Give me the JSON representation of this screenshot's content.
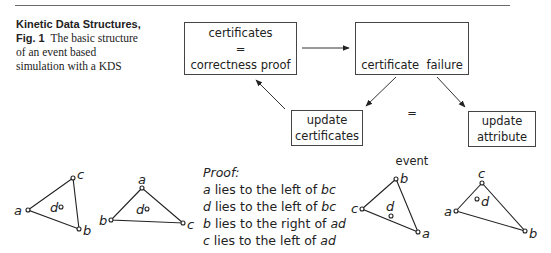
{
  "caption": {
    "heading": "Kinetic Data Structures,",
    "fig_label": "Fig. 1",
    "text_line1": "The basic structure",
    "text_line2": "of an event based",
    "text_line3": "simulation with a KDS"
  },
  "flow": {
    "boxes": [
      {
        "id": "certificates",
        "lines": [
          "certificates",
          "=",
          "correctness proof"
        ]
      },
      {
        "id": "certificate-failure",
        "lines": [
          "certificate  failure",
          "=",
          "event"
        ]
      },
      {
        "id": "update-certificates",
        "lines": [
          "update",
          "certificates"
        ]
      },
      {
        "id": "update-attribute",
        "lines": [
          "update",
          "attribute"
        ]
      }
    ],
    "edges": [
      {
        "from": "certificates",
        "to": "certificate-failure"
      },
      {
        "from": "certificate-failure",
        "to": "update-certificates"
      },
      {
        "from": "certificate-failure",
        "to": "update-attribute"
      },
      {
        "from": "update-certificates",
        "to": "certificates"
      }
    ]
  },
  "proof": {
    "title": "Proof:",
    "lines": [
      {
        "subject": "a",
        "text": " lies to the left of ",
        "object": "bc"
      },
      {
        "subject": "d",
        "text": " lies to the left of ",
        "object": "bc"
      },
      {
        "subject": "b",
        "text": " lies to the right of ",
        "object": "ad"
      },
      {
        "subject": "c",
        "text": " lies to the left of ",
        "object": "ad"
      }
    ]
  },
  "triangles": [
    {
      "points": {
        "a": "a",
        "b": "b",
        "c": "c"
      },
      "inner": "d"
    },
    {
      "points": {
        "a": "a",
        "b": "b",
        "c": "c"
      },
      "inner": "d"
    },
    {
      "points": {
        "a": "a",
        "b": "b",
        "c": "c"
      },
      "inner": "d"
    },
    {
      "points": {
        "a": "a",
        "b": "b",
        "c": "c"
      },
      "inner": "d"
    }
  ]
}
